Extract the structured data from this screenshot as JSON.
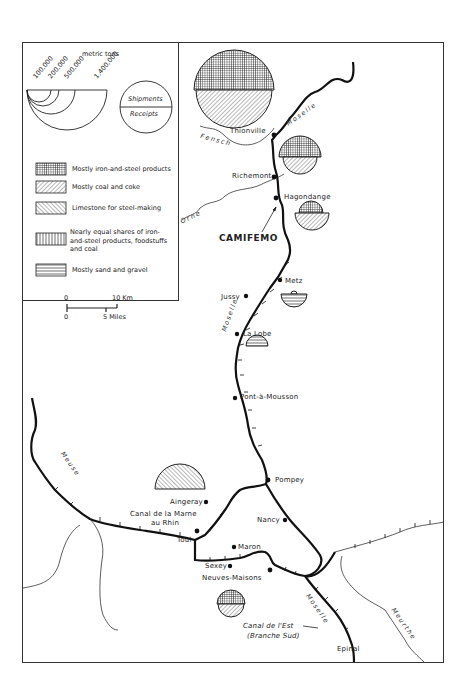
{
  "legend": {
    "unit_label": "metric tons",
    "size_scale": [
      "100,000",
      "200,000",
      "500,000",
      "1,400,000"
    ],
    "circle_key": {
      "top": "Shipments",
      "bottom": "Receipts"
    },
    "patterns": [
      {
        "pattern": "crosshatch-grid",
        "label": "Mostly iron-and-steel products"
      },
      {
        "pattern": "diagonal-right",
        "label": "Mostly coal and coke"
      },
      {
        "pattern": "diagonal-left",
        "label": "Limestone for steel-making"
      },
      {
        "pattern": "vertical-lines",
        "label": "Nearly equal shares of iron-and-steel products, foodstuffs and coal"
      },
      {
        "pattern": "horizontal-lines",
        "label": "Mostly sand and gravel"
      }
    ],
    "scale_bar": {
      "km_zero": "0",
      "km_max": "10 Km",
      "mi_zero": "0",
      "mi_max": "5 Miles"
    }
  },
  "rivers": {
    "moselle": "Moselle",
    "fensch": "Fensch",
    "orne": "Orne",
    "meuse": "Meuse",
    "meurthe": "Meurthe"
  },
  "places": {
    "thionville": "Thionville",
    "richemont": "Richemont",
    "hagondange": "Hagondange",
    "camifemo": "CAMIFEMO",
    "metz": "Metz",
    "jussy": "Jussy",
    "la_lobe": "La Lobe",
    "pont_a_mousson": "Pont-à-Mousson",
    "pompey": "Pompey",
    "aingeray": "Aingeray",
    "canal_marne_1": "Canal de la Marne",
    "canal_marne_2": "au Rhin",
    "nancy": "Nancy",
    "toul": "Toul",
    "maron": "Maron",
    "sexey": "Sexey",
    "neuves_maisons": "Neuves-Maisons",
    "canal_est_1": "Canal de l'Est",
    "canal_est_2": "(Branche Sud)",
    "epinal": "Epinal"
  },
  "ports": [
    {
      "name": "Thionville",
      "shipments": "iron-and-steel",
      "receipts": "coal-and-coke"
    },
    {
      "name": "Richemont",
      "shipments": "iron-and-steel",
      "receipts": "coal-and-coke"
    },
    {
      "name": "Hagondange",
      "shipments": "iron-and-steel",
      "receipts": "coal-and-coke"
    },
    {
      "name": "Metz",
      "shipments": "small",
      "receipts": "sand-and-gravel"
    },
    {
      "name": "La Lobe",
      "shipments": "sand-and-gravel",
      "receipts": "none"
    },
    {
      "name": "Toul / Aingeray",
      "shipments": "limestone",
      "receipts": "none"
    },
    {
      "name": "Neuves-Maisons",
      "shipments": "iron-and-steel",
      "receipts": "coal-and-coke"
    }
  ]
}
